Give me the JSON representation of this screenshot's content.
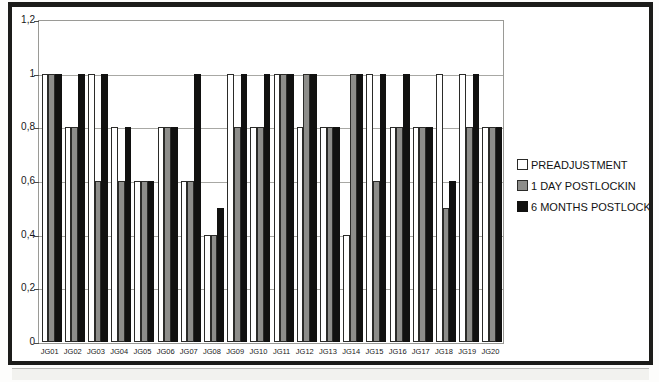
{
  "figure": {
    "background_color": "#ffffff",
    "frame_color": "#1c1c1a"
  },
  "legend": {
    "position": "right",
    "entries": [
      {
        "label": "PREADJUSTMENT",
        "color": "#ffffff",
        "swatch": "legend-swatch-preadjustment"
      },
      {
        "label": "1 DAY POSTLOCKIN",
        "color": "#8d8d8a",
        "swatch": "legend-swatch-1-day-postlockin"
      },
      {
        "label": "6 MONTHS POSTLOCKIN",
        "color": "#111110",
        "swatch": "legend-swatch-6-months-postlockin"
      }
    ]
  },
  "chart_data": {
    "type": "bar",
    "title": "",
    "xlabel": "",
    "ylabel": "",
    "ylim": [
      0,
      1.2
    ],
    "grid": true,
    "legend_position": "right",
    "ytick_labels": [
      "1,2",
      "1",
      "0,8",
      "0,6",
      "0,4",
      "0,2",
      "0"
    ],
    "ytick_values": [
      1.2,
      1.0,
      0.8,
      0.6,
      0.4,
      0.2,
      0
    ],
    "categories": [
      "JG01",
      "JG02",
      "JG03",
      "JG04",
      "JG05",
      "JG06",
      "JG07",
      "JG08",
      "JG09",
      "JG10",
      "JG11",
      "JG12",
      "JG13",
      "JG14",
      "JG15",
      "JG16",
      "JG17",
      "JG18",
      "JG19",
      "JG20"
    ],
    "series": [
      {
        "name": "PREADJUSTMENT",
        "color": "#ffffff",
        "values": [
          1.0,
          0.8,
          1.0,
          0.8,
          0.6,
          0.8,
          0.6,
          0.4,
          1.0,
          0.8,
          1.0,
          0.8,
          0.8,
          0.4,
          1.0,
          0.8,
          0.8,
          1.0,
          1.0,
          0.8
        ]
      },
      {
        "name": "1 DAY POSTLOCKIN",
        "color": "#8d8d8a",
        "values": [
          1.0,
          0.8,
          0.6,
          0.6,
          0.6,
          0.8,
          0.6,
          0.4,
          0.8,
          0.8,
          1.0,
          1.0,
          0.8,
          1.0,
          0.6,
          0.8,
          0.8,
          0.5,
          0.8,
          0.8
        ]
      },
      {
        "name": "6 MONTHS POSTLOCKIN",
        "color": "#111110",
        "values": [
          1.0,
          1.0,
          1.0,
          0.8,
          0.6,
          0.8,
          1.0,
          0.5,
          1.0,
          1.0,
          1.0,
          1.0,
          0.8,
          1.0,
          1.0,
          1.0,
          0.8,
          0.6,
          1.0,
          0.8
        ]
      }
    ]
  }
}
